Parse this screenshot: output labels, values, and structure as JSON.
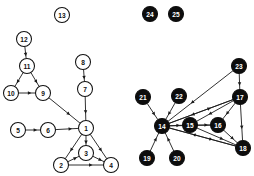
{
  "figure": {
    "type": "node-link-diagram",
    "width": 254,
    "height": 176,
    "background": "#ffffff",
    "panels": [
      {
        "id": "left-graph",
        "style": "open-nodes",
        "node_fill": "#ffffff",
        "node_stroke": "#111111",
        "label_color": "#111111"
      },
      {
        "id": "right-graph",
        "style": "filled-nodes",
        "node_fill": "#0d0d0d",
        "node_stroke": "#0d0d0d",
        "label_color": "#ffffff"
      }
    ]
  },
  "nodes": [
    {
      "id": 1,
      "label": "1",
      "x": 86,
      "y": 128,
      "r": 7.5,
      "style": "open",
      "panel": "left-graph"
    },
    {
      "id": 2,
      "label": "2",
      "x": 61,
      "y": 165,
      "r": 7.5,
      "style": "open",
      "panel": "left-graph"
    },
    {
      "id": 3,
      "label": "3",
      "x": 86,
      "y": 153,
      "r": 7.5,
      "style": "open",
      "panel": "left-graph"
    },
    {
      "id": 4,
      "label": "4",
      "x": 111,
      "y": 165,
      "r": 7.5,
      "style": "open",
      "panel": "left-graph"
    },
    {
      "id": 5,
      "label": "5",
      "x": 18,
      "y": 130,
      "r": 7.5,
      "style": "open",
      "panel": "left-graph"
    },
    {
      "id": 6,
      "label": "6",
      "x": 48,
      "y": 130,
      "r": 7.5,
      "style": "open",
      "panel": "left-graph"
    },
    {
      "id": 7,
      "label": "7",
      "x": 85,
      "y": 89,
      "r": 7.5,
      "style": "open",
      "panel": "left-graph"
    },
    {
      "id": 8,
      "label": "8",
      "x": 83,
      "y": 62,
      "r": 7.5,
      "style": "open",
      "panel": "left-graph"
    },
    {
      "id": 9,
      "label": "9",
      "x": 43,
      "y": 93,
      "r": 7.5,
      "style": "open",
      "panel": "left-graph"
    },
    {
      "id": 10,
      "label": "10",
      "x": 11,
      "y": 93,
      "r": 7.5,
      "style": "open",
      "panel": "left-graph"
    },
    {
      "id": 11,
      "label": "11",
      "x": 27,
      "y": 66,
      "r": 7.5,
      "style": "open",
      "panel": "left-graph"
    },
    {
      "id": 12,
      "label": "12",
      "x": 24,
      "y": 39,
      "r": 7.5,
      "style": "open",
      "panel": "left-graph"
    },
    {
      "id": 13,
      "label": "13",
      "x": 62,
      "y": 15,
      "r": 7.5,
      "style": "open",
      "panel": "left-graph"
    },
    {
      "id": 14,
      "label": "14",
      "x": 162,
      "y": 126,
      "r": 7.5,
      "style": "filled",
      "panel": "right-graph"
    },
    {
      "id": 15,
      "label": "15",
      "x": 190,
      "y": 125,
      "r": 7.5,
      "style": "filled",
      "panel": "right-graph"
    },
    {
      "id": 16,
      "label": "16",
      "x": 218,
      "y": 125,
      "r": 7.5,
      "style": "filled",
      "panel": "right-graph"
    },
    {
      "id": 17,
      "label": "17",
      "x": 240,
      "y": 97,
      "r": 7.5,
      "style": "filled",
      "panel": "right-graph"
    },
    {
      "id": 18,
      "label": "18",
      "x": 243,
      "y": 148,
      "r": 7.5,
      "style": "filled",
      "panel": "right-graph"
    },
    {
      "id": 19,
      "label": "19",
      "x": 147,
      "y": 158,
      "r": 7.5,
      "style": "filled",
      "panel": "right-graph"
    },
    {
      "id": 20,
      "label": "20",
      "x": 177,
      "y": 158,
      "r": 7.5,
      "style": "filled",
      "panel": "right-graph"
    },
    {
      "id": 21,
      "label": "21",
      "x": 143,
      "y": 97,
      "r": 7.5,
      "style": "filled",
      "panel": "right-graph"
    },
    {
      "id": 22,
      "label": "22",
      "x": 179,
      "y": 96,
      "r": 7.5,
      "style": "filled",
      "panel": "right-graph"
    },
    {
      "id": 23,
      "label": "23",
      "x": 239,
      "y": 66,
      "r": 7.5,
      "style": "filled",
      "panel": "right-graph"
    },
    {
      "id": 24,
      "label": "24",
      "x": 150,
      "y": 14,
      "r": 7.5,
      "style": "filled",
      "panel": "right-graph"
    },
    {
      "id": 25,
      "label": "25",
      "x": 176,
      "y": 14,
      "r": 7.5,
      "style": "filled",
      "panel": "right-graph"
    }
  ],
  "edges": [
    {
      "from": 12,
      "to": 11,
      "directed": true
    },
    {
      "from": 11,
      "to": 10,
      "directed": true
    },
    {
      "from": 11,
      "to": 9,
      "directed": true
    },
    {
      "from": 10,
      "to": 9,
      "directed": true
    },
    {
      "from": 9,
      "to": 1,
      "directed": true
    },
    {
      "from": 8,
      "to": 7,
      "directed": true
    },
    {
      "from": 7,
      "to": 1,
      "directed": true
    },
    {
      "from": 5,
      "to": 6,
      "directed": true
    },
    {
      "from": 6,
      "to": 1,
      "directed": true
    },
    {
      "from": 1,
      "to": 3,
      "directed": true
    },
    {
      "from": 1,
      "to": 2,
      "directed": true
    },
    {
      "from": 1,
      "to": 4,
      "directed": true
    },
    {
      "from": 2,
      "to": 3,
      "directed": true
    },
    {
      "from": 3,
      "to": 4,
      "directed": true
    },
    {
      "from": 2,
      "to": 4,
      "directed": true
    },
    {
      "from": 21,
      "to": 14,
      "directed": true
    },
    {
      "from": 22,
      "to": 14,
      "directed": true
    },
    {
      "from": 19,
      "to": 14,
      "directed": true
    },
    {
      "from": 20,
      "to": 14,
      "directed": true
    },
    {
      "from": 23,
      "to": 14,
      "directed": true
    },
    {
      "from": 23,
      "to": 17,
      "directed": true
    },
    {
      "from": 17,
      "to": 14,
      "directed": true
    },
    {
      "from": 17,
      "to": 15,
      "directed": true
    },
    {
      "from": 17,
      "to": 16,
      "directed": true
    },
    {
      "from": 17,
      "to": 18,
      "directed": true
    },
    {
      "from": 14,
      "to": 15,
      "directed": true
    },
    {
      "from": 14,
      "to": 16,
      "directed": true
    },
    {
      "from": 14,
      "to": 17,
      "directed": true
    },
    {
      "from": 14,
      "to": 18,
      "directed": true
    },
    {
      "from": 15,
      "to": 16,
      "directed": true
    },
    {
      "from": 15,
      "to": 18,
      "directed": true
    },
    {
      "from": 16,
      "to": 18,
      "directed": true
    },
    {
      "from": 18,
      "to": 14,
      "directed": true
    }
  ],
  "isolated_nodes": [
    13,
    24,
    25
  ]
}
